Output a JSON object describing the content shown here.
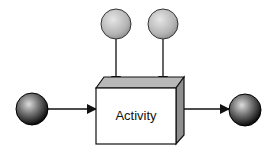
{
  "diagram": {
    "activity": {
      "label": "Activity"
    },
    "nodes": [
      {
        "id": "input",
        "kind": "dark-sphere"
      },
      {
        "id": "resource-1",
        "kind": "light-sphere"
      },
      {
        "id": "resource-2",
        "kind": "light-sphere"
      },
      {
        "id": "output",
        "kind": "dark-sphere"
      }
    ],
    "colors": {
      "line": "#111111",
      "box_front": "#ffffff",
      "box_top": "#b8b8b8",
      "box_side": "#8f8f8f"
    }
  }
}
